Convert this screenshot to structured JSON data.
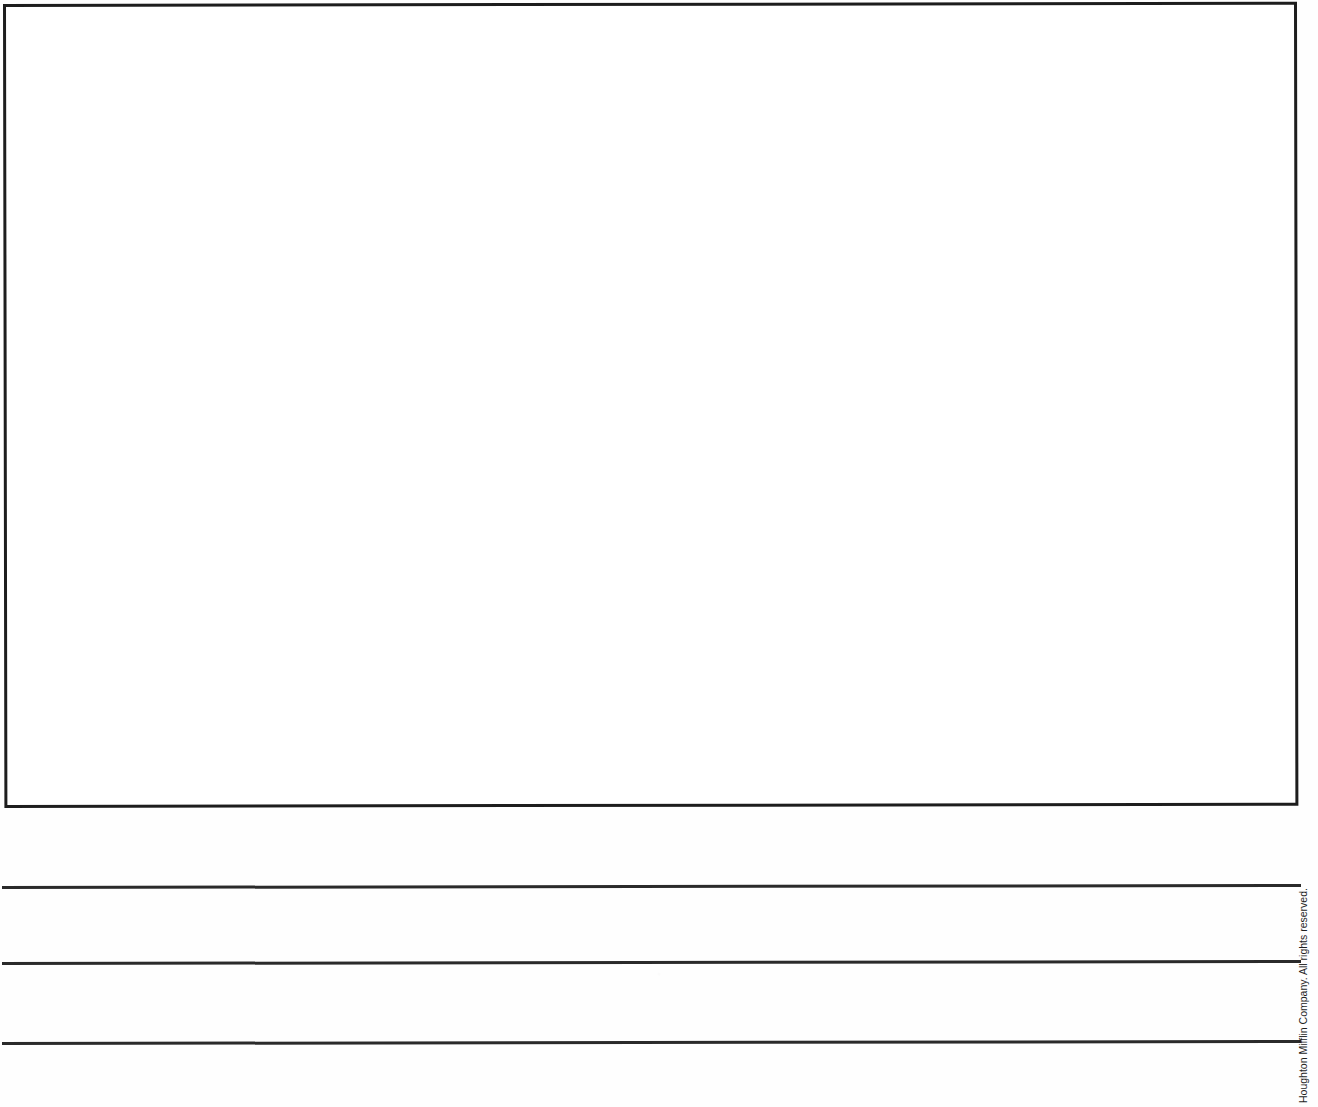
{
  "page": {
    "type": "worksheet-page",
    "width": 1318,
    "height": 1107,
    "background_color": "#ffffff",
    "ink_color": "#1d1d1d"
  },
  "drawing_frame": {
    "name": "drawing-box",
    "content": "",
    "description": "empty bordered drawing area",
    "border_color": "#1d1d1d",
    "border_width_px": 3,
    "fill_color": "#ffffff"
  },
  "writing_lines": {
    "count": 3,
    "color": "#2a2a2a",
    "lines": [
      {
        "id": "line-1",
        "content": ""
      },
      {
        "id": "line-2",
        "content": ""
      },
      {
        "id": "line-3",
        "content": ""
      }
    ]
  },
  "copyright": {
    "text": "Houghton Mifflin Company. All rights reserved.",
    "orientation": "vertical-rotated-90",
    "color": "#1f1f1f"
  }
}
